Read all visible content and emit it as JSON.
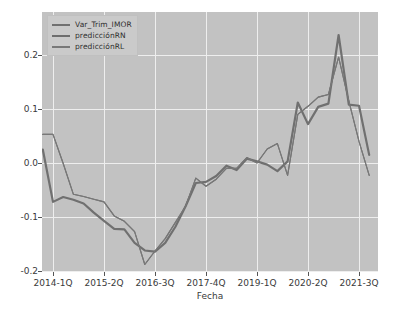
{
  "chart_data": {
    "type": "line",
    "title": "",
    "xlabel": "Fecha",
    "ylabel": "",
    "grid": true,
    "legend_position": "upper left",
    "xlim": [
      0,
      33
    ],
    "ylim": [
      -0.2,
      0.24
    ],
    "ytick_labels": [
      "0.2",
      "0.1",
      "0.0",
      "-0.1",
      "-0.2"
    ],
    "ytick_values": [
      0.2,
      0.1,
      0.0,
      -0.1,
      -0.2
    ],
    "xtick_labels": [
      "2014-1Q",
      "2015-2Q",
      "2016-3Q",
      "2017-4Q",
      "2019-1Q",
      "2020-2Q",
      "2021-3Q"
    ],
    "xtick_indices": [
      1,
      6,
      11,
      16,
      21,
      26,
      31
    ],
    "x": [
      0,
      1,
      2,
      3,
      4,
      5,
      6,
      7,
      8,
      9,
      10,
      11,
      12,
      13,
      14,
      15,
      16,
      17,
      18,
      19,
      20,
      21,
      22,
      23,
      24,
      25,
      26,
      27,
      28,
      29,
      30,
      31,
      32
    ],
    "series": [
      {
        "name": "Var_Trim_IMOR",
        "color": "#707070",
        "linewidth": 2.2,
        "values": [
          0.025,
          -0.072,
          -0.063,
          -0.068,
          -0.075,
          -0.092,
          -0.107,
          -0.122,
          -0.123,
          -0.148,
          -0.162,
          -0.164,
          -0.148,
          -0.118,
          -0.08,
          -0.037,
          -0.035,
          -0.024,
          -0.005,
          -0.013,
          0.008,
          0.003,
          -0.003,
          -0.015,
          0.003,
          0.112,
          0.072,
          0.104,
          0.11,
          0.237,
          0.108,
          0.106,
          0.015
        ]
      },
      {
        "name": "predicciónRN",
        "color": "#6d6d6d",
        "linewidth": 1.1,
        "values": [
          0.053,
          0.053,
          -0.001,
          -0.058,
          -0.062,
          -0.067,
          -0.072,
          -0.098,
          -0.108,
          -0.127,
          -0.188,
          -0.163,
          -0.14,
          -0.11,
          -0.08,
          -0.028,
          -0.043,
          -0.03,
          -0.01,
          -0.01,
          0.01,
          0.0,
          0.026,
          0.036,
          -0.023,
          0.09,
          0.105,
          0.122,
          0.127,
          0.196,
          0.115,
          0.04,
          -0.023
        ]
      },
      {
        "name": "predicciónRL",
        "color": "#787878",
        "linewidth": 1.1,
        "values": [
          0.053,
          0.053,
          -0.001,
          -0.058,
          -0.062,
          -0.067,
          -0.072,
          -0.098,
          -0.108,
          -0.127,
          -0.188,
          -0.163,
          -0.14,
          -0.11,
          -0.08,
          -0.028,
          -0.043,
          -0.03,
          -0.01,
          -0.01,
          0.01,
          0.0,
          0.026,
          0.036,
          -0.023,
          0.09,
          0.105,
          0.122,
          0.127,
          0.196,
          0.115,
          0.04,
          -0.023
        ]
      }
    ],
    "legend_entries": [
      {
        "label": "Var_Trim_IMOR",
        "color": "#707070"
      },
      {
        "label": "predicciónRN",
        "color": "#6d6d6d"
      },
      {
        "label": "predicciónRL",
        "color": "#787878"
      }
    ],
    "colors": {
      "plot_background": "#c2c2c2",
      "figure_background": "#ffffff",
      "gridline": "#eeeeee",
      "tick_text": "#3a3a3a"
    }
  }
}
